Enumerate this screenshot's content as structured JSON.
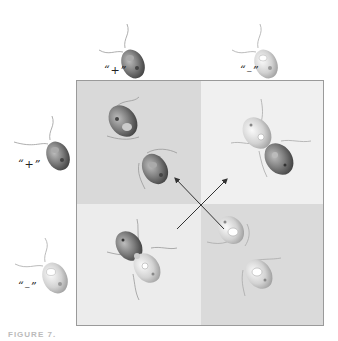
{
  "figure": {
    "caption": "FIGURE 7.",
    "colors": {
      "quadrant_top_left": "#d9d9d9",
      "quadrant_top_right": "#f0f0f0",
      "quadrant_bottom_left": "#ececec",
      "quadrant_bottom_right": "#dadada",
      "border": "#9a9a9a",
      "arrow": "#333333"
    }
  },
  "column_headers": [
    {
      "label": "“+”"
    },
    {
      "label": "“–”"
    }
  ],
  "row_headers": [
    {
      "label": "“+”"
    },
    {
      "label": "“–”"
    }
  ],
  "cells": [
    {
      "position": "top-left",
      "row": "+",
      "col": "+",
      "content": "two separate dark cells"
    },
    {
      "position": "top-right",
      "row": "+",
      "col": "–",
      "content": "conjugating pair (light + dark)"
    },
    {
      "position": "bottom-left",
      "row": "–",
      "col": "+",
      "content": "conjugating pair (dark + light)"
    },
    {
      "position": "bottom-right",
      "row": "–",
      "col": "–",
      "content": "two separate light cells"
    }
  ],
  "arrows": [
    {
      "from": "bottom-right",
      "to": "top-left"
    },
    {
      "from": "bottom-left",
      "to": "top-right"
    }
  ]
}
